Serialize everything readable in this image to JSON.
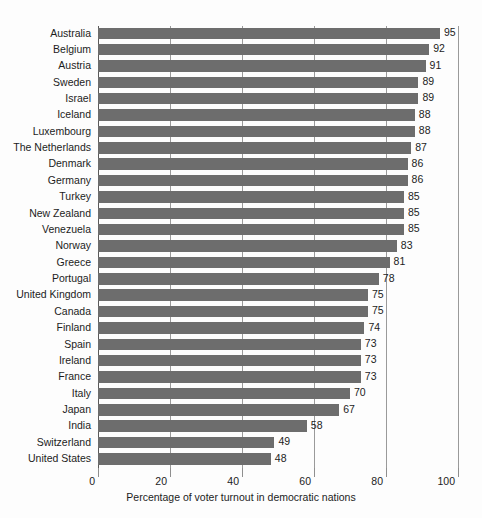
{
  "chart_data": {
    "type": "bar",
    "orientation": "horizontal",
    "title": "",
    "xlabel": "Percentage of voter turnout in democratic nations",
    "ylabel": "",
    "xlim": [
      0,
      100
    ],
    "xticks": [
      0,
      20,
      40,
      60,
      80,
      100
    ],
    "xtick_labels": [
      "0",
      "20",
      "40",
      "60",
      "80",
      "100"
    ],
    "grid": true,
    "legend": false,
    "bar_color": "#6d6d6d",
    "categories": [
      "Australia",
      "Belgium",
      "Austria",
      "Sweden",
      "Israel",
      "Iceland",
      "Luxembourg",
      "The Netherlands",
      "Denmark",
      "Germany",
      "Turkey",
      "New Zealand",
      "Venezuela",
      "Norway",
      "Greece",
      "Portugal",
      "United Kingdom",
      "Canada",
      "Finland",
      "Spain",
      "Ireland",
      "France",
      "Italy",
      "Japan",
      "India",
      "Switzerland",
      "United States"
    ],
    "values": [
      95,
      92,
      91,
      89,
      89,
      88,
      88,
      87,
      86,
      86,
      85,
      85,
      85,
      83,
      81,
      78,
      75,
      75,
      74,
      73,
      73,
      73,
      70,
      67,
      58,
      49,
      48
    ],
    "value_labels": [
      "95",
      "92",
      "91",
      "89",
      "89",
      "88",
      "88",
      "87",
      "86",
      "86",
      "85",
      "85",
      "85",
      "83",
      "81",
      "78",
      "75",
      "75",
      "74",
      "73",
      "73",
      "73",
      "70",
      "67",
      "58",
      "49",
      "48"
    ]
  }
}
